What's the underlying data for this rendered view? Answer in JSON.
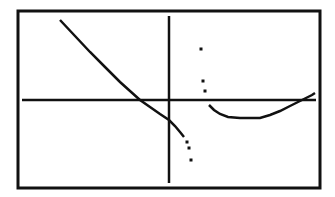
{
  "chart_data": {
    "type": "line",
    "title": "",
    "xlabel": "",
    "ylabel": "",
    "grid": false,
    "legend": null,
    "axes": {
      "x_axis_visible": true,
      "y_axis_visible": true,
      "tick_labels": []
    },
    "series": [
      {
        "name": "left-branch",
        "style": "connected-pixels",
        "points_px": [
          [
            60,
            20
          ],
          [
            75,
            36
          ],
          [
            90,
            52
          ],
          [
            105,
            67
          ],
          [
            120,
            82
          ],
          [
            130,
            91
          ],
          [
            140,
            100
          ],
          [
            150,
            107
          ],
          [
            160,
            114
          ],
          [
            169,
            120
          ],
          [
            175,
            126
          ],
          [
            180,
            132
          ],
          [
            184,
            137
          ]
        ]
      },
      {
        "name": "left-branch-dots",
        "style": "dots",
        "points_px": [
          [
            187,
            142
          ],
          [
            189,
            148
          ],
          [
            191,
            160
          ]
        ]
      },
      {
        "name": "right-branch-dots",
        "style": "dots",
        "points_px": [
          [
            201,
            49
          ],
          [
            203,
            81
          ],
          [
            205,
            91
          ]
        ]
      },
      {
        "name": "right-branch",
        "style": "connected-pixels",
        "points_px": [
          [
            209,
            105
          ],
          [
            214,
            110
          ],
          [
            220,
            114
          ],
          [
            228,
            117
          ],
          [
            240,
            118
          ],
          [
            250,
            118
          ],
          [
            260,
            118
          ],
          [
            270,
            115
          ],
          [
            280,
            111
          ],
          [
            290,
            106
          ],
          [
            300,
            101
          ],
          [
            306,
            98
          ],
          [
            312,
            95
          ],
          [
            315,
            93
          ]
        ]
      }
    ],
    "features": {
      "x_intercepts_px": [
        140,
        300
      ],
      "y_intercept_px": 120,
      "vertical_asymptote_px_x": 196,
      "local_min_px": [
        245,
        118
      ]
    }
  },
  "screen": {
    "frame": {
      "left": 18,
      "top": 11,
      "right": 320,
      "bottom": 188
    },
    "x_axis": {
      "y": 100,
      "x1": 22,
      "x2": 316
    },
    "y_axis": {
      "x": 169,
      "y1": 16,
      "y2": 183
    },
    "ink_color": "#111111",
    "bg_color": "#ffffff"
  }
}
